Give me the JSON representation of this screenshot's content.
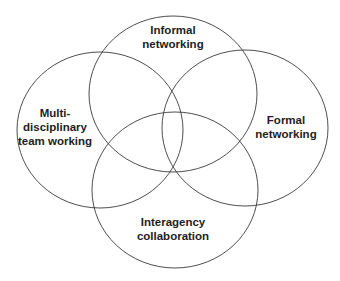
{
  "diagram": {
    "type": "venn",
    "stroke_color": "#3a3a3a",
    "text_color": "#1e1e1e",
    "circles": [
      {
        "id": "informal-networking",
        "lines": [
          "Informal",
          "networking"
        ],
        "cx": 173,
        "cy": 94,
        "rx": 84,
        "ry": 78,
        "label_x": 173,
        "label_y": 23
      },
      {
        "id": "multidisciplinary-team-working",
        "lines": [
          "Multi-",
          "disciplinary",
          "team working"
        ],
        "cx": 100,
        "cy": 130,
        "rx": 83,
        "ry": 78,
        "label_x": 55,
        "label_y": 106
      },
      {
        "id": "formal-networking",
        "lines": [
          "Formal",
          "networking"
        ],
        "cx": 245,
        "cy": 128,
        "rx": 83,
        "ry": 78,
        "label_x": 286,
        "label_y": 113
      },
      {
        "id": "interagency-collaboration",
        "lines": [
          "Interagency",
          "collaboration"
        ],
        "cx": 175,
        "cy": 190,
        "rx": 83,
        "ry": 78,
        "label_x": 173,
        "label_y": 215
      }
    ]
  }
}
